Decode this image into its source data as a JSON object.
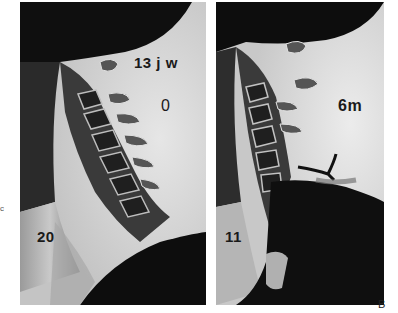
{
  "figure": {
    "panel_letter": "B",
    "edge_mark": "c",
    "panels": [
      {
        "id": "left",
        "description": "lateral cervical spine radiograph",
        "labels": {
          "age": "13 j w",
          "angle": "0",
          "number": "20"
        }
      },
      {
        "id": "right",
        "description": "lateral cervical spine radiograph with instrument",
        "labels": {
          "age": "6m",
          "number": "11"
        }
      }
    ]
  },
  "colors": {
    "background": "#ffffff",
    "film_light": "#d9d9d9",
    "film_dark": "#0d0d0d",
    "label": "#1a1a1a"
  }
}
